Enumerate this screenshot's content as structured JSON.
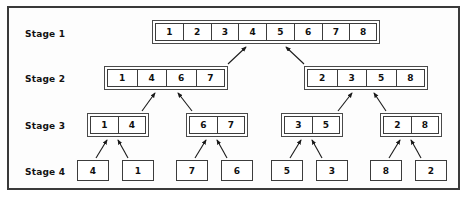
{
  "diagram": {
    "frame_color": "#3a3a3a",
    "box_color": "#3c3c3c",
    "arrow_color": "#1a1a1a",
    "stages": [
      {
        "label": "Stage 1"
      },
      {
        "label": "Stage 2"
      },
      {
        "label": "Stage 3"
      },
      {
        "label": "Stage 4"
      }
    ],
    "stage1": {
      "arrays": [
        {
          "values": [
            "1",
            "2",
            "3",
            "4",
            "5",
            "6",
            "7",
            "8"
          ]
        }
      ]
    },
    "stage2": {
      "arrays": [
        {
          "values": [
            "1",
            "4",
            "6",
            "7"
          ]
        },
        {
          "values": [
            "2",
            "3",
            "5",
            "8"
          ]
        }
      ]
    },
    "stage3": {
      "arrays": [
        {
          "values": [
            "1",
            "4"
          ]
        },
        {
          "values": [
            "6",
            "7"
          ]
        },
        {
          "values": [
            "3",
            "5"
          ]
        },
        {
          "values": [
            "2",
            "8"
          ]
        }
      ]
    },
    "stage4": {
      "leaves": [
        "4",
        "1",
        "7",
        "6",
        "5",
        "3",
        "8",
        "2"
      ]
    }
  }
}
